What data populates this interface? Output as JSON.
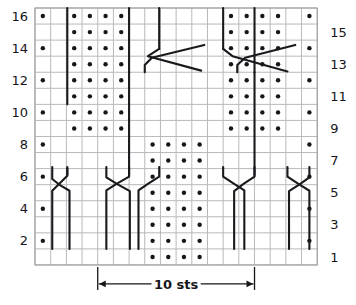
{
  "chart_data": {
    "type": "table",
    "title": "",
    "cols": 18,
    "rows": 16,
    "repeat_label": "10 sts",
    "repeat_start_col": 5,
    "repeat_end_col": 14,
    "row_labels_left": [
      "16",
      "14",
      "12",
      "10",
      "8",
      "6",
      "4",
      "2"
    ],
    "row_labels_right": [
      "15",
      "13",
      "11",
      "9",
      "7",
      "5",
      "3",
      "1"
    ],
    "symbol_legend": {
      "dot": "purl stitch",
      "blank": "knit stitch",
      "line": "cable travel / twist"
    },
    "purl_dots": [
      {
        "row": 16,
        "cols": [
          1,
          3,
          4,
          5,
          6,
          13,
          14,
          15,
          16,
          18
        ]
      },
      {
        "row": 15,
        "cols": [
          3,
          4,
          5,
          6,
          13,
          14,
          15,
          16
        ]
      },
      {
        "row": 14,
        "cols": [
          1,
          3,
          4,
          5,
          6,
          13,
          14,
          15,
          16,
          18
        ]
      },
      {
        "row": 13,
        "cols": [
          3,
          4,
          5,
          6,
          13,
          14,
          15,
          16
        ]
      },
      {
        "row": 12,
        "cols": [
          1,
          3,
          4,
          5,
          6,
          13,
          14,
          15,
          16,
          18
        ]
      },
      {
        "row": 11,
        "cols": [
          3,
          4,
          5,
          6,
          13,
          14,
          15,
          16
        ]
      },
      {
        "row": 10,
        "cols": [
          1,
          3,
          4,
          5,
          6,
          13,
          14,
          15,
          16,
          18
        ]
      },
      {
        "row": 9,
        "cols": [
          3,
          4,
          5,
          6,
          13,
          14,
          15,
          16
        ]
      },
      {
        "row": 8,
        "cols": [
          1,
          8,
          9,
          10,
          11,
          18
        ]
      },
      {
        "row": 7,
        "cols": [
          8,
          9,
          10,
          11
        ]
      },
      {
        "row": 6,
        "cols": [
          1,
          8,
          9,
          10,
          11,
          18
        ]
      },
      {
        "row": 5,
        "cols": [
          8,
          9,
          10,
          11
        ]
      },
      {
        "row": 4,
        "cols": [
          1,
          8,
          9,
          10,
          11,
          18
        ]
      },
      {
        "row": 3,
        "cols": [
          8,
          9,
          10,
          11
        ]
      },
      {
        "row": 2,
        "cols": [
          1,
          8,
          9,
          10,
          11,
          18
        ]
      },
      {
        "row": 1,
        "cols": [
          8,
          9,
          10,
          11
        ]
      }
    ],
    "cable_lines": [
      {
        "name": "left-outer-vertical-upper",
        "points": [
          [
            2.06,
            16.0
          ],
          [
            2.06,
            10.0
          ]
        ]
      },
      {
        "name": "col5-vertical-top",
        "points": [
          [
            6.0,
            16.0
          ],
          [
            6.0,
            12.0
          ]
        ]
      },
      {
        "name": "col7-vertical-top",
        "points": [
          [
            7.92,
            16.0
          ],
          [
            7.92,
            13.45
          ]
        ]
      },
      {
        "name": "left-cross-over-13",
        "points": [
          [
            7.92,
            13.45
          ],
          [
            7.2,
            13.0
          ],
          [
            10.6,
            12.1
          ]
        ]
      },
      {
        "name": "left-cross-under-13",
        "points": [
          [
            7.0,
            12.0
          ],
          [
            7.0,
            12.45
          ],
          [
            7.45,
            12.9
          ],
          [
            10.8,
            13.7
          ]
        ]
      },
      {
        "name": "right-cross-over-13",
        "points": [
          [
            12.9,
            12.0
          ],
          [
            12.9,
            12.45
          ],
          [
            13.4,
            12.9
          ],
          [
            16.6,
            13.7
          ]
        ]
      },
      {
        "name": "right-cross-under-13",
        "points": [
          [
            12.0,
            13.45
          ],
          [
            12.6,
            13.0
          ],
          [
            16.1,
            12.05
          ]
        ]
      },
      {
        "name": "col12-vertical-top",
        "points": [
          [
            12.0,
            16.0
          ],
          [
            12.0,
            13.45
          ]
        ]
      },
      {
        "name": "col14-vertical-top",
        "points": [
          [
            14.0,
            16.0
          ],
          [
            14.0,
            12.0
          ]
        ]
      },
      {
        "name": "col14-vertical-mid",
        "points": [
          [
            14.0,
            12.0
          ],
          [
            14.0,
            5.6
          ]
        ]
      },
      {
        "name": "col6-vertical-mid",
        "points": [
          [
            6.0,
            12.0
          ],
          [
            6.0,
            5.6
          ]
        ]
      },
      {
        "name": "left-outer-vertical-lower",
        "points": [
          [
            2.06,
            6.0
          ],
          [
            2.06,
            5.6
          ]
        ]
      },
      {
        "name": "r6-left-cross-a",
        "points": [
          [
            2.06,
            6.1
          ],
          [
            2.06,
            5.55
          ],
          [
            1.55,
            5.05
          ],
          [
            1.1,
            4.62
          ],
          [
            1.1,
            1.0
          ]
        ]
      },
      {
        "name": "r6-left-cross-b",
        "points": [
          [
            1.1,
            6.1
          ],
          [
            1.1,
            5.35
          ],
          [
            1.62,
            4.95
          ],
          [
            2.2,
            4.62
          ],
          [
            2.2,
            1.0
          ]
        ]
      },
      {
        "name": "r6-inner-left-a",
        "points": [
          [
            6.0,
            6.1
          ],
          [
            6.0,
            5.5
          ],
          [
            5.2,
            5.05
          ],
          [
            4.55,
            4.65
          ],
          [
            4.55,
            1.0
          ]
        ]
      },
      {
        "name": "r6-inner-left-b",
        "points": [
          [
            4.55,
            6.1
          ],
          [
            4.55,
            5.45
          ],
          [
            5.3,
            5.0
          ],
          [
            6.05,
            4.6
          ],
          [
            6.05,
            1.0
          ]
        ]
      },
      {
        "name": "r6-center-left-a",
        "points": [
          [
            7.92,
            6.1
          ],
          [
            7.92,
            5.5
          ],
          [
            7.2,
            5.05
          ],
          [
            6.6,
            4.65
          ],
          [
            6.6,
            1.0
          ]
        ]
      },
      {
        "name": "r6-center-right-b",
        "points": [
          [
            12.0,
            6.1
          ],
          [
            12.0,
            5.5
          ],
          [
            12.7,
            5.05
          ],
          [
            13.35,
            4.65
          ],
          [
            13.35,
            1.0
          ]
        ]
      },
      {
        "name": "r6-inner-right-a",
        "points": [
          [
            14.0,
            6.1
          ],
          [
            14.0,
            5.5
          ],
          [
            13.3,
            5.05
          ],
          [
            12.7,
            4.6
          ],
          [
            12.7,
            1.0
          ]
        ]
      },
      {
        "name": "r6-outer-right-a",
        "points": [
          [
            16.1,
            6.1
          ],
          [
            16.1,
            5.5
          ],
          [
            16.8,
            5.05
          ],
          [
            17.5,
            4.62
          ],
          [
            17.5,
            1.0
          ]
        ]
      },
      {
        "name": "r6-outer-right-b",
        "points": [
          [
            17.5,
            6.1
          ],
          [
            17.5,
            5.45
          ],
          [
            16.85,
            5.0
          ],
          [
            16.2,
            4.6
          ],
          [
            16.2,
            1.0
          ]
        ]
      }
    ]
  },
  "labels": {
    "repeat_text": "10 sts"
  }
}
